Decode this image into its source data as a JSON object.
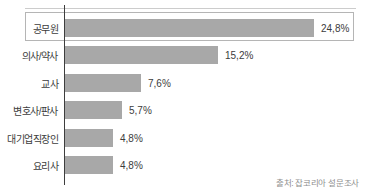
{
  "chart_data": {
    "type": "bar",
    "orientation": "horizontal",
    "title": "",
    "categories": [
      "공무원",
      "의사/약사",
      "교사",
      "변호사/판사",
      "대기업직장인",
      "요리사"
    ],
    "values": [
      24.8,
      15.2,
      7.6,
      5.7,
      4.8,
      4.8
    ],
    "value_labels": [
      "24,8%",
      "15,2%",
      "7,6%",
      "5,7%",
      "4,8%",
      "4,8%"
    ],
    "highlighted_category": "공무원",
    "highlighted_index": 0,
    "xlim": [
      0,
      29
    ],
    "grid": false,
    "legend": false,
    "bar_color": "#a8a8a8",
    "highlight_border_color": "#b5b5b5",
    "axis_color": "#3d3d3d",
    "source": "출처: 잡코리아 설문조사"
  }
}
